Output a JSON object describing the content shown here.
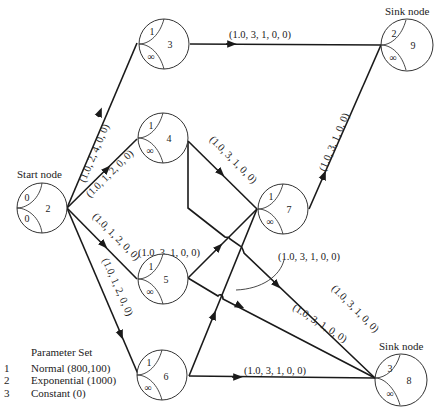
{
  "diagram": {
    "type": "network",
    "nodes": [
      {
        "id": "2",
        "role": "Start node",
        "top": "0",
        "bottom": "0",
        "caption": "Start node"
      },
      {
        "id": "3",
        "top": "1",
        "bottom": "∞"
      },
      {
        "id": "4",
        "top": "1",
        "bottom": "∞"
      },
      {
        "id": "5",
        "top": "1",
        "bottom": "∞"
      },
      {
        "id": "6",
        "top": "1",
        "bottom": "∞"
      },
      {
        "id": "7",
        "top": "1",
        "bottom": "∞"
      },
      {
        "id": "9",
        "role": "Sink node",
        "top": "2",
        "bottom": "∞",
        "caption": "Sink node"
      },
      {
        "id": "8",
        "role": "Sink node",
        "top": "3",
        "bottom": "∞",
        "caption": "Sink node"
      }
    ],
    "edges": [
      {
        "from": "2",
        "to": "3",
        "label": "(1.0, 2, 4, 0, 0)"
      },
      {
        "from": "2",
        "to": "4",
        "label": "(1.0, 1, 2, 0, 0)"
      },
      {
        "from": "2",
        "to": "5",
        "label": "(1.0, 1, 2, 0, 0)"
      },
      {
        "from": "2",
        "to": "6",
        "label": "(1.0, 1, 2, 0, 0)"
      },
      {
        "from": "3",
        "to": "9",
        "label": "(1.0, 3, 1, 0, 0)"
      },
      {
        "from": "4",
        "to": "7",
        "label": "(1.0, 3, 1, 0, 0)"
      },
      {
        "from": "4",
        "to": "8",
        "label": "(1.0, 3, 1, 0, 0)"
      },
      {
        "from": "5",
        "to": "7",
        "label": "(1.0, 3, 1, 0, 0)"
      },
      {
        "from": "5",
        "to": "8",
        "label": "(1.0, 3, 1, 0, 0)"
      },
      {
        "from": "6",
        "to": "7",
        "label": "(1.0, 3, 1, 0, 0)"
      },
      {
        "from": "6",
        "to": "8",
        "label": "(1.0, 3, 1, 0, 0)"
      },
      {
        "from": "7",
        "to": "9",
        "label": "(1.0, 3, 1, 0, 0)"
      }
    ]
  },
  "labels": {
    "e2_3": "(1.0, 2, 4, 0, 0)",
    "e2_4": "(1.0, 1, 2, 0, 0)",
    "e2_5": "(1.0, 1, 2, 0, 0)",
    "e2_6": "(1.0, 1, 2, 0, 0)",
    "e3_9": "(1.0, 3, 1, 0, 0)",
    "e4_7": "(1.0, 3, 1, 0, 0)",
    "e4_8": "(1.0, 3, 1, 0, 0)",
    "e5_7": "(1.0, 3, 1, 0, 0)",
    "e5_8": "(1.0, 3, 1, 0, 0)",
    "e6_7": "(1.0, 3, 1, 0, 0)",
    "e6_8": "(1.0, 3, 1, 0, 0)",
    "e7_9": "(1.0, 3, 1, 0, 0)"
  },
  "captions": {
    "start": "Start node",
    "sink9": "Sink node",
    "sink8": "Sink node"
  },
  "nodes": {
    "n2": {
      "id": "2",
      "top": "0",
      "bottom": "0"
    },
    "n3": {
      "id": "3",
      "top": "1",
      "bottom": "∞"
    },
    "n4": {
      "id": "4",
      "top": "1",
      "bottom": "∞"
    },
    "n5": {
      "id": "5",
      "top": "1",
      "bottom": "∞"
    },
    "n6": {
      "id": "6",
      "top": "1",
      "bottom": "∞"
    },
    "n7": {
      "id": "7",
      "top": "1",
      "bottom": "∞"
    },
    "n9": {
      "id": "9",
      "top": "2",
      "bottom": "∞"
    },
    "n8": {
      "id": "8",
      "top": "3",
      "bottom": "∞"
    }
  },
  "legend": {
    "title": "Parameter Set",
    "items": [
      {
        "num": "1",
        "text": "Normal (800,100)"
      },
      {
        "num": "2",
        "text": "Exponential (1000)"
      },
      {
        "num": "3",
        "text": "Constant (0)"
      }
    ]
  }
}
